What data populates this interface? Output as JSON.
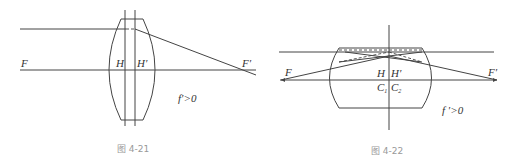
{
  "figures": [
    {
      "id": "fig-4-21",
      "caption": "图 4-21",
      "labels": {
        "F": "F",
        "H": "H",
        "H_prime": "H′",
        "F_prime": "F′",
        "condition": "f′>0"
      },
      "description": "Biconvex thick lens with principal planes H and H′; parallel ray converges to back focal point F′"
    },
    {
      "id": "fig-4-22",
      "caption": "图 4-22",
      "labels": {
        "F": "F",
        "H": "H",
        "H_prime": "H′",
        "C1": "C",
        "C1_sub": "1",
        "C2": "C",
        "C2_sub": "2",
        "F_prime": "F′",
        "condition": "f ′>0"
      },
      "description": "Thick meniscus-like lens with coincident centers C1, C2 and principal planes H, H′; rays shown with dashed construction lines"
    }
  ]
}
